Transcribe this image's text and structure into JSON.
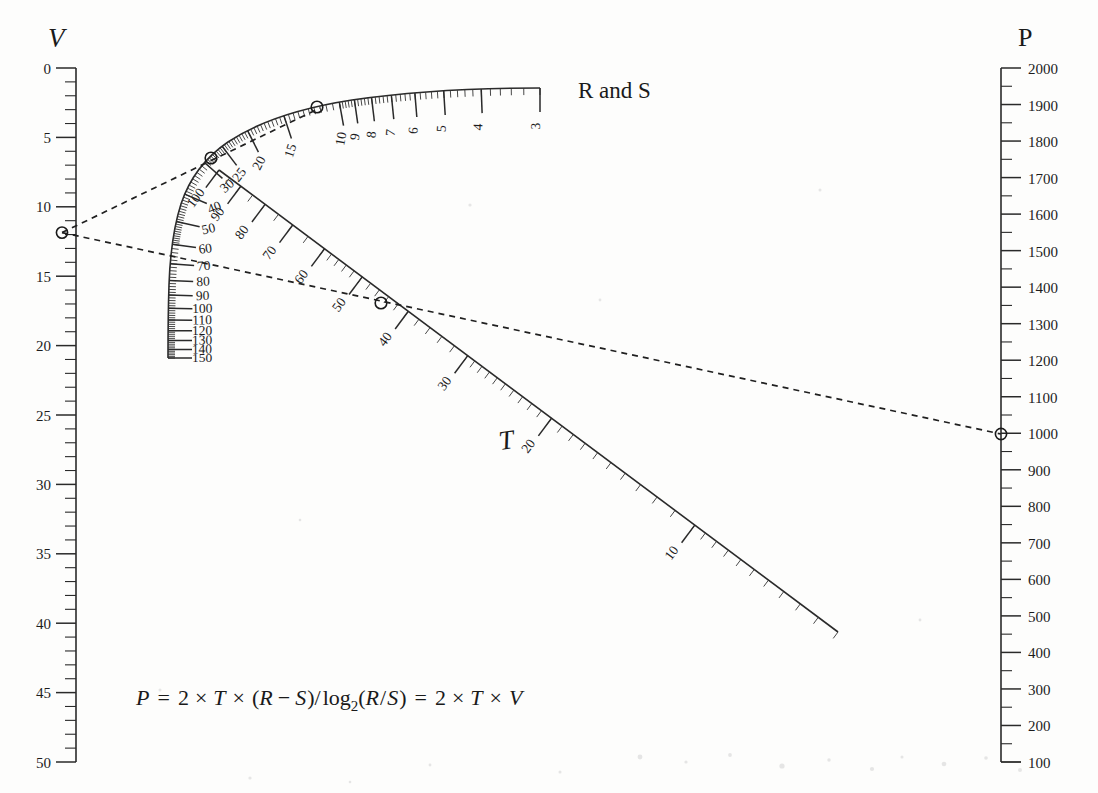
{
  "figure": {
    "type": "nomogram",
    "formula": "P = 2 × T × (R − S)/log₂(R/S) = 2 × T × V",
    "formula_parts": {
      "p": "P",
      "eq1": "=",
      "two_a": "2",
      "times_a": "×",
      "t_a": "T",
      "times_b": "×",
      "paren_open": "(",
      "r_a": "R",
      "minus": "−",
      "s_a": "S",
      "paren_close": ")",
      "slash": "/",
      "log": "log",
      "logsub": "2",
      "paren2_open": "(",
      "r_b": "R",
      "slash2": "/",
      "s_b": "S",
      "paren2_close": ")",
      "eq2": "=",
      "two_b": "2",
      "times_c": "×",
      "t_b": "T",
      "times_d": "×",
      "v_b": "V"
    }
  },
  "scales": {
    "v": {
      "title": "V",
      "orientation": "vertical-left",
      "min": 0,
      "max": 50,
      "major_step": 5,
      "minor_step": 1,
      "labels": [
        "0",
        "5",
        "10",
        "15",
        "20",
        "25",
        "30",
        "35",
        "40",
        "45",
        "50"
      ],
      "values": [
        0,
        5,
        10,
        15,
        20,
        25,
        30,
        35,
        40,
        45,
        50
      ],
      "marker_value": 12
    },
    "p": {
      "title": "P",
      "orientation": "vertical-right",
      "min": 100,
      "max": 2000,
      "major_step": 100,
      "minor_step": 50,
      "labels": [
        "2000",
        "1900",
        "1800",
        "1700",
        "1600",
        "1500",
        "1400",
        "1300",
        "1200",
        "1100",
        "1000",
        "900",
        "800",
        "700",
        "600",
        "500",
        "400",
        "300",
        "200",
        "100"
      ],
      "values": [
        2000,
        1900,
        1800,
        1700,
        1600,
        1500,
        1400,
        1300,
        1200,
        1100,
        1000,
        900,
        800,
        700,
        600,
        500,
        400,
        300,
        200,
        100
      ],
      "marker_value": 960
    },
    "rs": {
      "title": "R and S",
      "orientation": "curved",
      "labels": [
        "3",
        "4",
        "5",
        "6",
        "7",
        "8",
        "9",
        "10",
        "15",
        "20",
        "25",
        "30",
        "40",
        "50",
        "60",
        "70",
        "80",
        "90",
        "100",
        "110",
        "120",
        "130",
        "140",
        "150"
      ],
      "values": [
        3,
        4,
        5,
        6,
        7,
        8,
        9,
        10,
        15,
        20,
        25,
        30,
        40,
        50,
        60,
        70,
        80,
        90,
        100,
        110,
        120,
        130,
        140,
        150
      ],
      "marker_values": [
        8,
        35
      ]
    },
    "t": {
      "title": "T",
      "orientation": "diagonal",
      "labels": [
        "10",
        "20",
        "30",
        "40",
        "50",
        "60",
        "70",
        "80",
        "90",
        "100"
      ],
      "values": [
        10,
        20,
        30,
        40,
        50,
        60,
        70,
        80,
        90,
        100
      ],
      "marker_value": 35
    }
  },
  "index_lines": [
    {
      "name": "upper-index-line",
      "from": "V=12",
      "to": "R=8"
    },
    {
      "name": "lower-index-line",
      "from": "V=12",
      "to": "P=960"
    }
  ],
  "colors": {
    "ink": "#1a1a1a",
    "background": "#fdfdfc",
    "dash": "#202020"
  }
}
